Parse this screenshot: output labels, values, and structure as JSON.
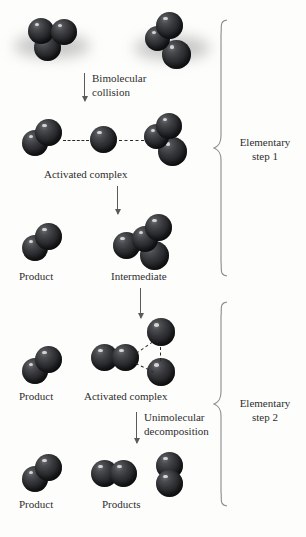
{
  "figure": {
    "type": "reaction-mechanism-diagram",
    "background_color": "#fdfdfc",
    "atom_color": "#232427",
    "bond_dash_color": "#2b2b2b",
    "arrow_color": "#5a5a5a"
  },
  "process_labels": {
    "bimolecular_collision": "Bimolecular\ncollision",
    "bimolecular_collision_line1": "Bimolecular",
    "bimolecular_collision_line2": "collision",
    "unimolecular_decomposition_line1": "Unimolecular",
    "unimolecular_decomposition_line2": "decomposition"
  },
  "species_labels": {
    "activated_complex_1": "Activated complex",
    "product_1": "Product",
    "intermediate": "Intermediate",
    "product_2": "Product",
    "activated_complex_2": "Activated complex",
    "product_3": "Product",
    "products": "Products"
  },
  "steps": [
    {
      "id": "step-1",
      "line1": "Elementary",
      "line2": "step 1"
    },
    {
      "id": "step-2",
      "line1": "Elementary",
      "line2": "step 2"
    }
  ],
  "molecules": {
    "reactant_a": {
      "name": "reactant-molecule-a",
      "atom_count": 3
    },
    "reactant_b": {
      "name": "reactant-molecule-b",
      "atom_count": 3
    },
    "complex1_left": {
      "name": "complex1-left-fragment",
      "atom_count": 2
    },
    "complex1_middle": {
      "name": "complex1-transferred-atom",
      "atom_count": 1
    },
    "complex1_right": {
      "name": "complex1-right-fragment",
      "atom_count": 3
    },
    "product1": {
      "name": "product-molecule-1",
      "atom_count": 2
    },
    "intermediate": {
      "name": "intermediate-molecule",
      "atom_count": 4
    },
    "product2": {
      "name": "product-molecule-2",
      "atom_count": 2
    },
    "complex2_core": {
      "name": "complex2-core-fragment",
      "atom_count": 2
    },
    "complex2_top": {
      "name": "complex2-top-atom",
      "atom_count": 1
    },
    "complex2_bottom": {
      "name": "complex2-bottom-atom",
      "atom_count": 1
    },
    "product3": {
      "name": "product-molecule-3",
      "atom_count": 2
    },
    "products_left": {
      "name": "products-molecule-left",
      "atom_count": 2
    },
    "products_right": {
      "name": "products-molecule-right",
      "atom_count": 2
    }
  }
}
